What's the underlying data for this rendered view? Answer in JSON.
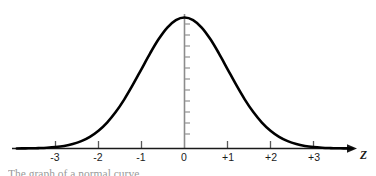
{
  "figure": {
    "title": "",
    "background_color": "#ffffff",
    "curve_color": "#000000",
    "axis_color": "#1a1a1a",
    "vertical_axis_color": "#808080",
    "label_color": "#1a1a1a",
    "caption_partial": "The graph of a normal curve",
    "x_axis_name": "Z"
  },
  "chart_data": {
    "type": "line",
    "title": "",
    "subtitle": "",
    "xlabel": "Z",
    "ylabel": "",
    "xlim": [
      -3.9,
      4.0
    ],
    "ylim": [
      0,
      0.43
    ],
    "grid": false,
    "legend": null,
    "tick_labels": [
      "-3",
      "-2",
      "-1",
      "0",
      "+1",
      "+2",
      "+3"
    ],
    "tick_values": [
      -3,
      -2,
      -1,
      0,
      1,
      2,
      3
    ],
    "series": [
      {
        "name": "standard normal density",
        "x": [
          -3.9,
          -3.7,
          -3.5,
          -3.4,
          -3.2,
          -3.0,
          -2.8,
          -2.6,
          -2.4,
          -2.2,
          -2.0,
          -1.8,
          -1.6,
          -1.4,
          -1.2,
          -1.0,
          -0.8,
          -0.6,
          -0.4,
          -0.2,
          0.0,
          0.2,
          0.4,
          0.6,
          0.8,
          1.0,
          1.2,
          1.4,
          1.6,
          1.8,
          2.0,
          2.2,
          2.4,
          2.6,
          2.8,
          3.0,
          3.2,
          3.4,
          3.5,
          3.7,
          3.9
        ],
        "y": [
          0.0002,
          0.0004,
          0.0009,
          0.0012,
          0.0024,
          0.0044,
          0.0079,
          0.0136,
          0.0224,
          0.0355,
          0.054,
          0.079,
          0.1109,
          0.1497,
          0.1942,
          0.242,
          0.2897,
          0.3332,
          0.3683,
          0.391,
          0.3989,
          0.391,
          0.3683,
          0.3332,
          0.2897,
          0.242,
          0.1942,
          0.1497,
          0.1109,
          0.079,
          0.054,
          0.0355,
          0.0224,
          0.0136,
          0.0079,
          0.0044,
          0.0024,
          0.0012,
          0.0009,
          0.0004,
          0.0002
        ]
      }
    ]
  },
  "axis": {
    "x_ticks": [
      {
        "label": "-3",
        "value": -3
      },
      {
        "label": "-2",
        "value": -2
      },
      {
        "label": "-1",
        "value": -1
      },
      {
        "label": "0",
        "value": 0
      },
      {
        "label": "+1",
        "value": 1
      },
      {
        "label": "+2",
        "value": 2
      },
      {
        "label": "+3",
        "value": 3
      }
    ],
    "x_axis_label": "Z"
  }
}
